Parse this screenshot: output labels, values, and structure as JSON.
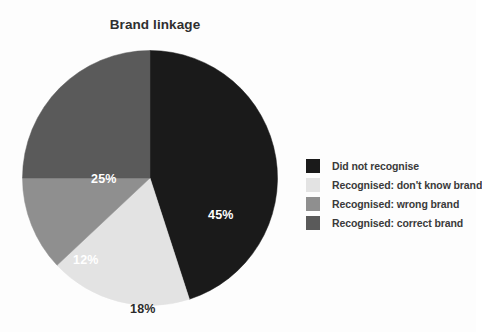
{
  "chart_data": {
    "type": "pie",
    "title": "Brand linkage",
    "xlabel": "",
    "ylabel": "",
    "legend_position": "right",
    "grid": false,
    "start_angle_deg": 0,
    "direction": "clockwise",
    "categories": [
      "Did not recognise",
      "Recognised: don't know brand",
      "Recognised: wrong brand",
      "Recognised: correct brand"
    ],
    "values": [
      45,
      18,
      12,
      25
    ],
    "value_labels": [
      "45%",
      "18%",
      "12%",
      "25%"
    ],
    "colors": [
      "#1a1a1a",
      "#e3e3e3",
      "#8f8f8f",
      "#5a5a5a"
    ],
    "label_text_colors": [
      "#ffffff",
      "#2b2b2b",
      "#ffffff",
      "#ffffff"
    ],
    "units": "percent"
  },
  "chart": {
    "title": "Brand linkage",
    "background": "#fdfdfd",
    "title_color": "#2f2f2f",
    "slices": [
      {
        "label": "Did not recognise",
        "value": 45,
        "value_label": "45%",
        "color": "#1a1a1a"
      },
      {
        "label": "Recognised: don't know brand",
        "value": 18,
        "value_label": "18%",
        "color": "#e3e3e3"
      },
      {
        "label": "Recognised: wrong brand",
        "value": 12,
        "value_label": "12%",
        "color": "#8f8f8f"
      },
      {
        "label": "Recognised: correct brand",
        "value": 25,
        "value_label": "25%",
        "color": "#5a5a5a"
      }
    ]
  },
  "legend": {
    "items": [
      {
        "label": "Did not recognise",
        "color": "#1a1a1a"
      },
      {
        "label": "Recognised: don't know brand",
        "color": "#e3e3e3"
      },
      {
        "label": "Recognised: wrong brand",
        "color": "#8f8f8f"
      },
      {
        "label": "Recognised: correct brand",
        "color": "#5a5a5a"
      }
    ]
  }
}
